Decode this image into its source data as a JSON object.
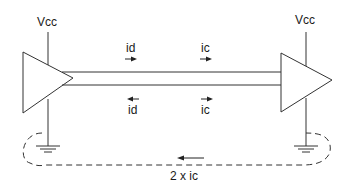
{
  "diagram": {
    "type": "circuit",
    "labels": {
      "vcc_left": "Vcc",
      "vcc_right": "Vcc",
      "top_id": "id",
      "top_ic": "ic",
      "bottom_id": "id",
      "bottom_ic": "ic",
      "return_current": "2 x ic"
    },
    "arrows": {
      "top_id": "right",
      "top_ic": "right",
      "bottom_id": "left",
      "bottom_ic": "right",
      "return_current": "left"
    },
    "components": [
      {
        "name": "driver",
        "shape": "triangle-buffer",
        "side": "left"
      },
      {
        "name": "receiver",
        "shape": "triangle-buffer",
        "side": "right"
      },
      {
        "name": "ground-left",
        "shape": "ground-symbol"
      },
      {
        "name": "ground-right",
        "shape": "ground-symbol"
      }
    ],
    "colors": {
      "line": "#333333",
      "background": "#ffffff"
    }
  }
}
